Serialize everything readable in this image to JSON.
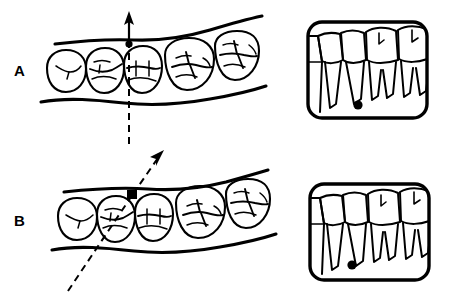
{
  "figure": {
    "kind": "dental-radiography-technique-illustration",
    "background_color": "#ffffff",
    "ink_color": "#000000",
    "width": 453,
    "height": 300
  },
  "panels": [
    {
      "id": "A",
      "label": "A",
      "label_position": {
        "x": 14,
        "y": 63
      },
      "occlusal_view": {
        "name": "occlusal-view-arch-a",
        "description": "occlusal view of posterior mandibular arch with five teeth between buccal and lingual ridge lines",
        "tooth_count": 5,
        "teeth": [
          {
            "name": "premolar-1",
            "type": "premolar"
          },
          {
            "name": "premolar-2",
            "type": "premolar"
          },
          {
            "name": "premolar-3",
            "type": "premolar"
          },
          {
            "name": "molar-1",
            "type": "molar"
          },
          {
            "name": "molar-2",
            "type": "molar"
          }
        ]
      },
      "beam": {
        "name": "x-ray-beam-perpendicular",
        "orientation": "vertical",
        "angle_degrees": 90,
        "arrow_direction": "up",
        "entry_point_marker": "filled-dot",
        "line_style": "dashed",
        "contact_point": "third-tooth-interproximal"
      },
      "film": {
        "name": "radiograph-film-a",
        "frame": {
          "x": 308,
          "y": 22,
          "width": 119,
          "height": 96,
          "corner_radius": 14
        },
        "result": "open contacts, no overlap",
        "tooth_count": 5,
        "reference_dot": {
          "x": 358,
          "y": 105,
          "radius": 4.6
        }
      }
    },
    {
      "id": "B",
      "label": "B",
      "label_position": {
        "x": 14,
        "y": 213
      },
      "occlusal_view": {
        "name": "occlusal-view-arch-b",
        "description": "occlusal view of posterior mandibular arch with five teeth between buccal and lingual ridge lines",
        "tooth_count": 5,
        "teeth": [
          {
            "name": "premolar-1",
            "type": "premolar"
          },
          {
            "name": "premolar-2",
            "type": "premolar"
          },
          {
            "name": "premolar-3",
            "type": "premolar"
          },
          {
            "name": "molar-1",
            "type": "molar"
          },
          {
            "name": "molar-2",
            "type": "molar"
          }
        ]
      },
      "beam": {
        "name": "x-ray-beam-oblique",
        "orientation": "oblique",
        "angle_degrees": 55,
        "arrow_direction": "up-right",
        "entry_point_marker": "filled-square",
        "line_style": "dashed",
        "contact_point": "second-third-tooth-interproximal"
      },
      "film": {
        "name": "radiograph-film-b",
        "frame": {
          "x": 310,
          "y": 184,
          "width": 119,
          "height": 96,
          "corner_radius": 14
        },
        "result": "overlapped contacts",
        "tooth_count": 5,
        "reference_dot": {
          "x": 352,
          "y": 265,
          "radius": 4.6
        }
      }
    }
  ]
}
